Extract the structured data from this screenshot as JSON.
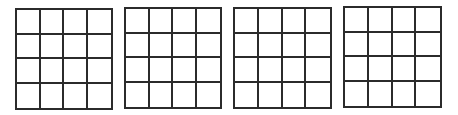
{
  "grids": [
    {
      "id": "grid-1",
      "rows": 4,
      "cols": 4,
      "left": 15,
      "top": 8,
      "width": 98,
      "height": 102
    },
    {
      "id": "grid-2",
      "rows": 4,
      "cols": 4,
      "left": 124,
      "top": 7,
      "width": 98,
      "height": 102
    },
    {
      "id": "grid-3",
      "rows": 4,
      "cols": 4,
      "left": 233,
      "top": 7,
      "width": 99,
      "height": 102
    },
    {
      "id": "grid-4",
      "rows": 4,
      "cols": 4,
      "left": 343,
      "top": 6,
      "width": 99,
      "height": 102
    }
  ],
  "colors": {
    "line": "#2b2b2b",
    "background": "#ffffff"
  }
}
